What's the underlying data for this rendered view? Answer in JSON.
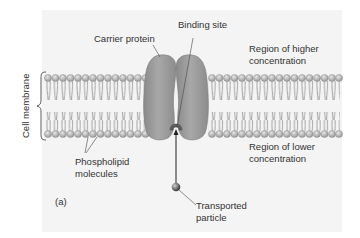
{
  "figure": {
    "panel_label": "(a)",
    "labels": {
      "carrier_protein": "Carrier protein",
      "binding_site": "Binding site",
      "higher_region_line1": "Region of higher",
      "higher_region_line2": "concentration",
      "lower_region_line1": "Region of lower",
      "lower_region_line2": "concentration",
      "cell_membrane": "Cell membrane",
      "phospholipid_line1": "Phospholipid",
      "phospholipid_line2": "molecules",
      "particle_line1": "Transported",
      "particle_line2": "particle"
    },
    "colors": {
      "panel_bg": "#f4f4f4",
      "protein": "#9a9a9a",
      "lipid_head": "#b8b8b8",
      "particle": "#555555"
    }
  }
}
